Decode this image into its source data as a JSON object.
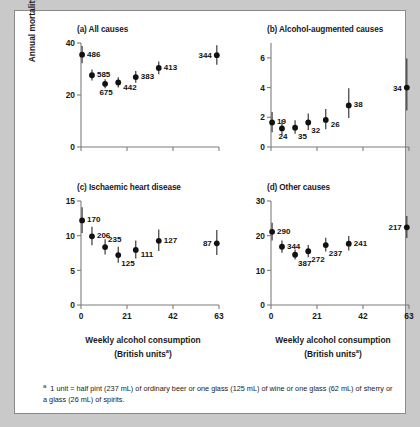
{
  "figure": {
    "y_axis_label": "Annual mortality per 1000 pyrs",
    "x_axis_label_line1": "Weekly alcohol consumption",
    "x_axis_label_line2_pre": "(British units",
    "x_axis_label_line2_sup": "a",
    "x_axis_label_line2_post": ")",
    "footnote_marker": "a",
    "footnote_text": "1 unit = half pint (237 mL) of ordinary beer or one glass (125 mL) of wine or one glass (62 mL) of sherry or a glass (26 mL) of spirits.",
    "colors": {
      "page_background": "#c9c9c9",
      "panel_background": "#ffffff",
      "marker": "#111111",
      "error_bar": "#3a3a3a",
      "axis": "#7d7d7d",
      "text": "#1a1a1a"
    }
  },
  "chart_data": [
    {
      "type": "scatter",
      "panel": "a",
      "title": "(a) All causes",
      "xlabel": "Weekly alcohol consumption (British units)",
      "ylabel": "Annual mortality per 1000 pyrs",
      "xlim": [
        0,
        63
      ],
      "ylim": [
        0,
        40
      ],
      "xticks": [
        0,
        21,
        42,
        63
      ],
      "xticklabels": [
        "",
        "",
        "",
        ""
      ],
      "yticks": [
        0,
        20,
        40
      ],
      "yticklabels": [
        "0",
        "20",
        "40"
      ],
      "grid": false,
      "legend": "none",
      "point_label_meaning": "number of deaths",
      "points": [
        {
          "label": "486",
          "x": 0.5,
          "y": 35.5,
          "ylow": 32.2,
          "yhigh": 38.8,
          "label_pos": "right"
        },
        {
          "label": "585",
          "x": 5.0,
          "y": 27.6,
          "ylow": 25.6,
          "yhigh": 29.8,
          "label_pos": "right"
        },
        {
          "label": "675",
          "x": 11.0,
          "y": 24.3,
          "ylow": 22.6,
          "yhigh": 26.1,
          "label_pos": "below"
        },
        {
          "label": "442",
          "x": 17.0,
          "y": 24.8,
          "ylow": 22.9,
          "yhigh": 26.8,
          "label_pos": "right-below"
        },
        {
          "label": "383",
          "x": 25.0,
          "y": 26.9,
          "ylow": 24.7,
          "yhigh": 29.2,
          "label_pos": "right"
        },
        {
          "label": "413",
          "x": 35.5,
          "y": 30.4,
          "ylow": 28.0,
          "yhigh": 32.9,
          "label_pos": "right"
        },
        {
          "label": "344",
          "x": 62.0,
          "y": 35.3,
          "ylow": 31.6,
          "yhigh": 39.1,
          "label_pos": "left"
        }
      ]
    },
    {
      "type": "scatter",
      "panel": "b",
      "title": "(b) Alcohol-augmented causes",
      "xlabel": "Weekly alcohol consumption (British units)",
      "ylabel": "Annual mortality per 1000 pyrs",
      "xlim": [
        0,
        63
      ],
      "ylim": [
        0,
        7
      ],
      "xticks": [
        0,
        21,
        42,
        63
      ],
      "xticklabels": [
        "",
        "",
        "",
        ""
      ],
      "yticks": [
        0,
        2,
        4,
        6
      ],
      "yticklabels": [
        "0",
        "2",
        "4",
        "6"
      ],
      "grid": false,
      "legend": "none",
      "point_label_meaning": "number of deaths",
      "points": [
        {
          "label": "19",
          "x": 0.5,
          "y": 1.65,
          "ylow": 1.0,
          "yhigh": 2.35,
          "label_pos": "right"
        },
        {
          "label": "24",
          "x": 5.0,
          "y": 1.25,
          "ylow": 0.8,
          "yhigh": 1.8,
          "label_pos": "below"
        },
        {
          "label": "35",
          "x": 11.0,
          "y": 1.3,
          "ylow": 0.9,
          "yhigh": 1.8,
          "label_pos": "below-right"
        },
        {
          "label": "32",
          "x": 17.0,
          "y": 1.65,
          "ylow": 1.15,
          "yhigh": 2.25,
          "label_pos": "below-right"
        },
        {
          "label": "26",
          "x": 25.0,
          "y": 1.82,
          "ylow": 1.2,
          "yhigh": 2.55,
          "label_pos": "right-below"
        },
        {
          "label": "38",
          "x": 35.5,
          "y": 2.8,
          "ylow": 1.95,
          "yhigh": 3.95,
          "label_pos": "right"
        },
        {
          "label": "34",
          "x": 62.0,
          "y": 4.0,
          "ylow": 2.45,
          "yhigh": 5.95,
          "label_pos": "left"
        }
      ]
    },
    {
      "type": "scatter",
      "panel": "c",
      "title": "(c) Ischaemic heart disease",
      "xlabel": "Weekly alcohol consumption (British units)",
      "ylabel": "Annual mortality per 1000 pyrs",
      "xlim": [
        0,
        63
      ],
      "ylim": [
        0,
        15
      ],
      "xticks": [
        0,
        21,
        42,
        63
      ],
      "xticklabels": [
        "0",
        "21",
        "42",
        "63"
      ],
      "yticks": [
        0,
        5,
        10,
        15
      ],
      "yticklabels": [
        "0",
        "5",
        "10",
        "15"
      ],
      "grid": false,
      "legend": "none",
      "point_label_meaning": "number of deaths",
      "points": [
        {
          "label": "170",
          "x": 0.5,
          "y": 12.2,
          "ylow": 10.4,
          "yhigh": 14.1,
          "label_pos": "right"
        },
        {
          "label": "206",
          "x": 5.0,
          "y": 9.9,
          "ylow": 8.6,
          "yhigh": 11.3,
          "label_pos": "right"
        },
        {
          "label": "235",
          "x": 11.0,
          "y": 8.35,
          "ylow": 7.3,
          "yhigh": 9.5,
          "label_pos": "above-right"
        },
        {
          "label": "125",
          "x": 17.0,
          "y": 7.2,
          "ylow": 6.1,
          "yhigh": 8.4,
          "label_pos": "below-right"
        },
        {
          "label": "111",
          "x": 25.0,
          "y": 7.95,
          "ylow": 6.7,
          "yhigh": 9.3,
          "label_pos": "right-below"
        },
        {
          "label": "127",
          "x": 35.5,
          "y": 9.25,
          "ylow": 7.8,
          "yhigh": 10.9,
          "label_pos": "right"
        },
        {
          "label": "87",
          "x": 62.0,
          "y": 8.9,
          "ylow": 7.2,
          "yhigh": 10.8,
          "label_pos": "left"
        }
      ]
    },
    {
      "type": "scatter",
      "panel": "d",
      "title": "(d) Other causes",
      "xlabel": "Weekly alcohol consumption (British units)",
      "ylabel": "Annual mortality per 1000 pyrs",
      "xlim": [
        0,
        63
      ],
      "ylim": [
        0,
        30
      ],
      "xticks": [
        0,
        21,
        42,
        63
      ],
      "xticklabels": [
        "0",
        "21",
        "42",
        "63"
      ],
      "yticks": [
        0,
        10,
        20,
        30
      ],
      "yticklabels": [
        "0",
        "10",
        "20",
        "30"
      ],
      "grid": false,
      "legend": "none",
      "point_label_meaning": "number of deaths",
      "points": [
        {
          "label": "290",
          "x": 0.5,
          "y": 21.1,
          "ylow": 18.6,
          "yhigh": 23.7,
          "label_pos": "right"
        },
        {
          "label": "344",
          "x": 5.0,
          "y": 16.8,
          "ylow": 15.1,
          "yhigh": 18.6,
          "label_pos": "right"
        },
        {
          "label": "387",
          "x": 11.0,
          "y": 14.5,
          "ylow": 13.1,
          "yhigh": 16.0,
          "label_pos": "below-right"
        },
        {
          "label": "272",
          "x": 17.0,
          "y": 15.5,
          "ylow": 13.8,
          "yhigh": 17.3,
          "label_pos": "below-right"
        },
        {
          "label": "237",
          "x": 25.0,
          "y": 17.3,
          "ylow": 15.4,
          "yhigh": 19.4,
          "label_pos": "below-right"
        },
        {
          "label": "241",
          "x": 35.5,
          "y": 17.7,
          "ylow": 15.7,
          "yhigh": 19.9,
          "label_pos": "right"
        },
        {
          "label": "217",
          "x": 62.0,
          "y": 22.4,
          "ylow": 19.3,
          "yhigh": 25.7,
          "label_pos": "left"
        }
      ]
    }
  ]
}
